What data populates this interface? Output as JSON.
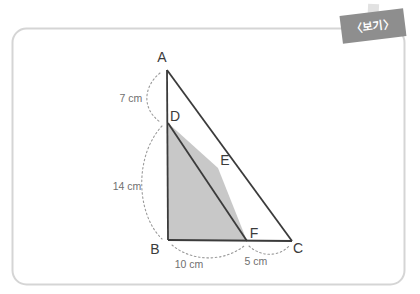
{
  "page": {
    "background_color": "#ffffff",
    "width": 420,
    "height": 294
  },
  "frame": {
    "name": "rounded-figure-frame",
    "border_color": "#d5d5d5",
    "x": 12,
    "y": 28,
    "width": 393,
    "height": 257,
    "corner_radius": 14
  },
  "tag": {
    "label": "〈보기〉",
    "background_color": "#8e8e8e",
    "text_color": "#ffffff",
    "tape_color": "#e2e2e2",
    "rotation_deg": -7
  },
  "diagram": {
    "stroke_color": "#3b3b3b",
    "shade_color": "#c8c8c8",
    "guide_color": "#9a9a9a",
    "vertices": [
      {
        "id": "A",
        "label": "A",
        "x": 167,
        "y": 70,
        "label_x": 162,
        "label_y": 62
      },
      {
        "id": "B",
        "label": "B",
        "x": 168,
        "y": 240,
        "label_x": 155,
        "label_y": 254
      },
      {
        "id": "C",
        "label": "C",
        "x": 292,
        "y": 241,
        "label_x": 296,
        "label_y": 253
      },
      {
        "id": "D",
        "label": "D",
        "x": 168,
        "y": 123,
        "label_x": 172,
        "label_y": 120
      },
      {
        "id": "E",
        "label": "E",
        "x": 218,
        "y": 168,
        "label_x": 221,
        "label_y": 164
      },
      {
        "id": "F",
        "label": "F",
        "x": 247,
        "y": 241,
        "label_x": 250,
        "label_y": 238
      }
    ],
    "segments": [
      {
        "name": "segment-ab",
        "from": "A",
        "to": "B"
      },
      {
        "name": "segment-ac",
        "from": "A",
        "to": "C"
      },
      {
        "name": "segment-bc",
        "from": "B",
        "to": "C"
      },
      {
        "name": "segment-df",
        "from": "D",
        "to": "F"
      }
    ],
    "shaded_region": {
      "name": "shaded-quadrilateral-bdef",
      "vertex_ids": [
        "B",
        "D",
        "E",
        "F"
      ],
      "points": "168,240 168,123 218,168 247,241"
    },
    "dimensions": [
      {
        "name": "dimension-ad",
        "value": "7 cm",
        "between": [
          "A",
          "D"
        ],
        "label_x": 131,
        "label_y": 102,
        "arc_path": "M 160,73 C 144,86 141,108 160,122"
      },
      {
        "name": "dimension-db",
        "value": "14 cm",
        "between": [
          "D",
          "B"
        ],
        "label_x": 127,
        "label_y": 190,
        "arc_path": "M 162,126 C 134,156 136,214 162,239"
      },
      {
        "name": "dimension-bf",
        "value": "10 cm",
        "between": [
          "B",
          "F"
        ],
        "label_x": 189,
        "label_y": 268,
        "arc_path": "M 172,245 C 192,262 224,262 244,246"
      },
      {
        "name": "dimension-fc",
        "value": "5 cm",
        "between": [
          "F",
          "C"
        ],
        "label_x": 256,
        "label_y": 265,
        "arc_path": "M 249,246 C 262,258 280,256 289,246"
      }
    ]
  }
}
